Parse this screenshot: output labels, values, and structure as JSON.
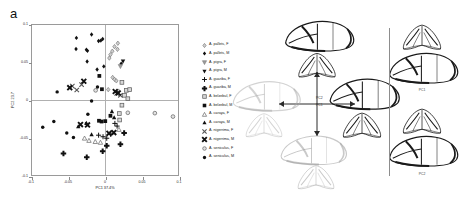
{
  "figure": {
    "panel_a_letter": "a",
    "panel_b_letter": "b"
  },
  "panel_a": {
    "xaxis": {
      "title": "PC1 37.4%",
      "ticks": [
        "-0.1",
        "-0.05",
        "0",
        "0.05",
        "0.1"
      ],
      "range": [
        -0.1,
        0.1
      ]
    },
    "yaxis": {
      "title": "PC2 23.7",
      "ticks": [
        "0.1",
        "0.05",
        "0",
        "-0.05",
        "-0.1"
      ],
      "range": [
        -0.1,
        0.1
      ]
    },
    "legend": [
      {
        "label": "A. pallets, F",
        "symbol": "diamond-open-grey"
      },
      {
        "label": "A. pallets, M",
        "symbol": "diamond-filled"
      },
      {
        "label": "A. pigra, F",
        "symbol": "triangle-down-grey"
      },
      {
        "label": "A. pigra, M",
        "symbol": "triangle-down-filled"
      },
      {
        "label": "A. guariba, F",
        "symbol": "plus-thin"
      },
      {
        "label": "A. guariba, M",
        "symbol": "plus-bold"
      },
      {
        "label": "A. belzebul, F",
        "symbol": "square-open-grey"
      },
      {
        "label": "A. belzebul, M",
        "symbol": "square-filled"
      },
      {
        "label": "A. caraya, F",
        "symbol": "triangle-up-grey"
      },
      {
        "label": "A. caraya, M",
        "symbol": "triangle-up-filled"
      },
      {
        "label": "A. nigerrima, F",
        "symbol": "cross-x-grey"
      },
      {
        "label": "A. nigerrima, M",
        "symbol": "cross-x-bold"
      },
      {
        "label": "A. seniculus, F",
        "symbol": "circle-open-grey"
      },
      {
        "label": "A. seniculus, M",
        "symbol": "circle-filled"
      }
    ]
  },
  "panel_b": {
    "axis_labels": {
      "horizontal": "PC1",
      "vertical": "PC2"
    },
    "sub_labels": [
      "PC1",
      "PC2"
    ],
    "skull_views": [
      "lateral",
      "dorsal"
    ]
  },
  "chart_data": {
    "type": "scatter",
    "title": "",
    "xlabel": "PC1 37.4%",
    "ylabel": "PC2 23.7",
    "xlim": [
      -0.1,
      0.1
    ],
    "ylim": [
      -0.1,
      0.1
    ],
    "xticks": [
      -0.1,
      -0.05,
      0,
      0.05,
      0.1
    ],
    "yticks": [
      -0.1,
      -0.05,
      0,
      0.05,
      0.1
    ],
    "grid": false,
    "legend_position": "right",
    "series": [
      {
        "name": "A. pallets, F",
        "symbol": "diamond-open-grey",
        "points": [
          [
            0.0115,
            0.0715
          ],
          [
            0.016,
            0.076
          ],
          [
            0.006,
            0.061
          ],
          [
            0.0085,
            0.0655
          ],
          [
            0.0155,
            0.068
          ],
          [
            0.0045,
            0.0565
          ],
          [
            0.009,
            0.031
          ],
          [
            0.0115,
            0.0285
          ],
          [
            0.014,
            0.0265
          ],
          [
            0.003,
            0.015
          ],
          [
            0.017,
            0.013
          ]
        ]
      },
      {
        "name": "A. pallets, M",
        "symbol": "diamond-filled",
        "points": [
          [
            -0.04,
            0.083
          ],
          [
            -0.0195,
            0.0875
          ],
          [
            -0.0405,
            0.0685
          ],
          [
            -0.0265,
            0.0675
          ],
          [
            -0.025,
            0.066
          ],
          [
            -0.01,
            0.079
          ],
          [
            -0.007,
            0.0795
          ],
          [
            -0.0045,
            0.0815
          ],
          [
            -0.0255,
            0.052
          ],
          [
            -0.012,
            0.0415
          ],
          [
            -0.003,
            0.0455
          ],
          [
            0.0205,
            0.049
          ]
        ]
      },
      {
        "name": "A. pigra, F",
        "symbol": "triangle-down-grey",
        "points": [
          [
            0.0195,
            0.0455
          ]
        ]
      },
      {
        "name": "A. pigra, M",
        "symbol": "triangle-down-filled",
        "points": [
          [
            0.023,
            0.052
          ]
        ]
      },
      {
        "name": "A. guariba, F",
        "symbol": "plus-thin",
        "points": [
          [
            -0.01,
            -0.045
          ],
          [
            -0.004,
            -0.047
          ],
          [
            0.001,
            -0.049
          ],
          [
            0.0065,
            -0.044
          ],
          [
            0.012,
            -0.0295
          ],
          [
            0.015,
            -0.033
          ]
        ]
      },
      {
        "name": "A. guariba, M",
        "symbol": "plus-bold",
        "points": [
          [
            -0.0575,
            -0.069
          ],
          [
            -0.026,
            -0.074
          ],
          [
            -0.0045,
            -0.066
          ],
          [
            0.001,
            -0.059
          ],
          [
            0.0195,
            -0.057
          ],
          [
            0.0245,
            -0.042
          ]
        ]
      },
      {
        "name": "A. belzebul, F",
        "symbol": "square-open-grey",
        "points": [
          [
            0.0215,
            0.0245
          ],
          [
            0.0275,
            0.014
          ],
          [
            0.032,
            0.015
          ],
          [
            0.025,
            0.0075
          ],
          [
            0.0295,
            0.003
          ],
          [
            0.0215,
            -0.0055
          ],
          [
            0.018,
            -0.0165
          ],
          [
            0.0185,
            -0.025
          ]
        ]
      },
      {
        "name": "A. belzebul, M",
        "symbol": "square-filled",
        "points": [
          [
            -0.009,
            0.033
          ],
          [
            -0.0055,
            0.0155
          ],
          [
            -0.0095,
            -0.026
          ],
          [
            -0.006,
            -0.027
          ],
          [
            -0.001,
            -0.0265
          ],
          [
            0.006,
            -0.0195
          ]
        ]
      },
      {
        "name": "A. caraya, F",
        "symbol": "triangle-up-grey",
        "points": [
          [
            -0.029,
            -0.049
          ],
          [
            -0.023,
            -0.052
          ],
          [
            -0.0145,
            -0.0535
          ],
          [
            -0.0075,
            -0.0545
          ],
          [
            0.0175,
            -0.0375
          ]
        ]
      },
      {
        "name": "A. caraya, M",
        "symbol": "triangle-up-filled",
        "points": [
          [
            -0.0375,
            -0.0335
          ],
          [
            -0.0265,
            -0.029
          ],
          [
            -0.0195,
            -0.044
          ],
          [
            0.008,
            -0.0135
          ],
          [
            0.011,
            -0.0215
          ]
        ]
      },
      {
        "name": "A. nigerrima, F",
        "symbol": "cross-x-grey",
        "points": [
          [
            -0.0455,
            0.0195
          ],
          [
            -0.033,
            0.0215
          ],
          [
            -0.0395,
            0.0145
          ],
          [
            0.0145,
            0.01
          ],
          [
            0.0195,
            0.0075
          ]
        ]
      },
      {
        "name": "A. nigerrima, M",
        "symbol": "cross-x-bold",
        "points": [
          [
            -0.049,
            0.0175
          ],
          [
            -0.03,
            0.026
          ],
          [
            -0.0345,
            -0.031
          ],
          [
            -0.025,
            -0.0315
          ],
          [
            0.004,
            -0.0425
          ],
          [
            0.0105,
            -0.0415
          ],
          [
            0.0165,
            0.0105
          ],
          [
            0.0125,
            0.0125
          ]
        ]
      },
      {
        "name": "A. seniculus, F",
        "symbol": "circle-open-grey",
        "points": [
          [
            -0.014,
            0.014
          ],
          [
            0.0295,
            -0.0155
          ],
          [
            0.066,
            -0.016
          ],
          [
            0.0905,
            -0.0205
          ]
        ]
      },
      {
        "name": "A. seniculus, M",
        "symbol": "circle-filled",
        "points": [
          [
            -0.066,
            0.012
          ],
          [
            -0.0855,
            -0.0345
          ],
          [
            -0.0705,
            -0.027
          ],
          [
            -0.053,
            -0.042
          ],
          [
            -0.044,
            -0.048
          ],
          [
            -0.0245,
            -0.0175
          ],
          [
            -0.0195,
            0.0
          ],
          [
            -0.0115,
            0.0185
          ]
        ]
      }
    ]
  }
}
